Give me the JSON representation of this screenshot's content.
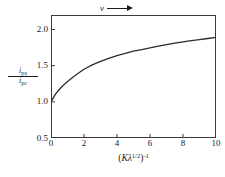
{
  "chart_data": {
    "type": "line",
    "title": "",
    "xlabel": "(Kλ^1/2)^-1",
    "xlabel_parts": {
      "open_paren": "(",
      "k": "K",
      "lambda": "λ",
      "lambda_exponent": "1/2",
      "close_paren": ")",
      "outer_exponent": "-1"
    },
    "ylabel": "i_pa / i_pc",
    "ylabel_parts": {
      "numerator_symbol": "i",
      "numerator_subscript": "pa",
      "denominator_symbol": "i",
      "denominator_subscript": "pc"
    },
    "xlim": [
      0,
      10
    ],
    "ylim": [
      0.5,
      2.2
    ],
    "xticks": [
      0,
      2,
      4,
      6,
      8,
      10
    ],
    "xtick_labels": [
      "0",
      "2",
      "4",
      "6",
      "8",
      "10"
    ],
    "yticks": [
      0.5,
      1.0,
      1.5,
      2.0
    ],
    "ytick_labels": [
      "0.5",
      "1.0",
      "1.5",
      "2.0"
    ],
    "grid": false,
    "legend": null,
    "annotations": [
      {
        "name": "scan-rate-arrow",
        "symbol": "v",
        "glyph": "arrow-right",
        "position": "top-center",
        "meaning": "increasing scan rate"
      }
    ],
    "series": [
      {
        "name": "ipa-over-ipc",
        "color": "#2b2b2b",
        "x": [
          0.0,
          0.25,
          0.5,
          0.75,
          1.0,
          1.5,
          2.0,
          2.5,
          3.0,
          3.5,
          4.0,
          4.5,
          5.0,
          5.5,
          6.0,
          6.5,
          7.0,
          7.5,
          8.0,
          8.5,
          9.0,
          9.5,
          10.0
        ],
        "y": [
          1.0,
          1.1,
          1.17,
          1.23,
          1.28,
          1.37,
          1.45,
          1.51,
          1.56,
          1.6,
          1.64,
          1.67,
          1.7,
          1.72,
          1.745,
          1.77,
          1.79,
          1.81,
          1.83,
          1.845,
          1.86,
          1.875,
          1.89
        ]
      }
    ]
  },
  "figure": {
    "background_color": "#ffffff",
    "axis_color": "#3a3a3a",
    "curve_color": "#2b2b2b"
  }
}
